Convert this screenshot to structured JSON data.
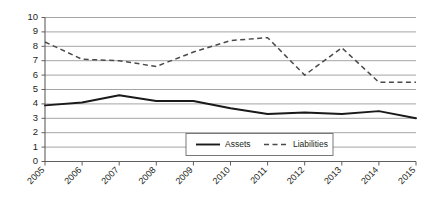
{
  "chart_data": {
    "type": "line",
    "title": "",
    "xlabel": "",
    "ylabel": "",
    "categories": [
      "2005",
      "2006",
      "2007",
      "2008",
      "2009",
      "2010",
      "2011",
      "2012",
      "2013",
      "2014",
      "2015"
    ],
    "series": [
      {
        "name": "Assets",
        "style": "solid",
        "color": "#1a1a1a",
        "values": [
          3.9,
          4.1,
          4.6,
          4.2,
          4.2,
          3.7,
          3.3,
          3.4,
          3.3,
          3.5,
          3.0
        ]
      },
      {
        "name": "Liabilities",
        "style": "dashed",
        "color": "#4a4a4a",
        "values": [
          8.3,
          7.1,
          7.0,
          6.6,
          7.6,
          8.4,
          8.6,
          6.0,
          7.9,
          5.5,
          5.5
        ]
      }
    ],
    "ylim": [
      0,
      10
    ],
    "ytick_labels": [
      "0",
      "1",
      "2",
      "3",
      "4",
      "5",
      "6",
      "7",
      "8",
      "9",
      "10"
    ],
    "grid": true,
    "grid_orientation": "horizontal",
    "legend_position": "bottom-center",
    "xtick_rotation": -45
  },
  "legend": {
    "entries": [
      {
        "label": "Assets",
        "style": "solid"
      },
      {
        "label": "Liabilities",
        "style": "dashed"
      }
    ]
  },
  "colors": {
    "assets": "#1a1a1a",
    "liabilities": "#4a4a4a",
    "gridline": "#9a9a9a",
    "axis": "#5f5f5f",
    "background": "#ffffff",
    "text": "#231f20"
  }
}
